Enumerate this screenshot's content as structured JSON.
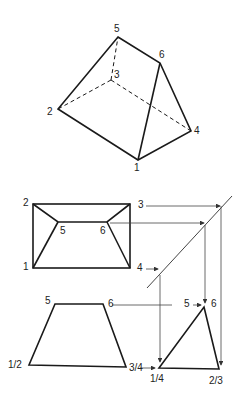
{
  "iso": {
    "labels": {
      "v5": "5",
      "v6": "6",
      "v3": "3",
      "v2": "2",
      "v4": "4",
      "v1": "1"
    }
  },
  "top": {
    "labels": {
      "v2": "2",
      "v3": "3",
      "v5": "5",
      "v6": "6",
      "v1": "1",
      "v4": "4"
    }
  },
  "front": {
    "labels": {
      "v5": "5",
      "v6": "6",
      "v12": "1/2",
      "v34": "3/4"
    }
  },
  "side": {
    "labels": {
      "v5": "5",
      "v6": "6",
      "v14": "1/4",
      "v23": "2/3"
    }
  },
  "colors": {
    "line": "#1a1a1a",
    "proj": "#444444"
  }
}
